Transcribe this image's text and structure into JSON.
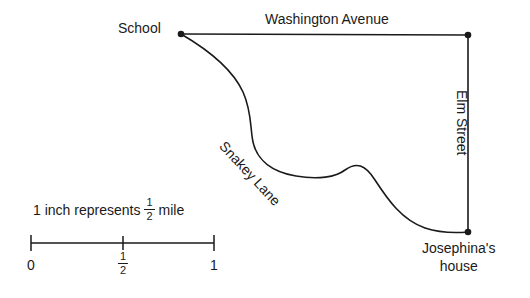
{
  "map": {
    "title_labels": {
      "school": "School",
      "washington_avenue": "Washington Avenue",
      "elm_street": "Elm Street",
      "snakey_lane": "Snakey Lane",
      "josephina_house_line1": "Josephina's",
      "josephina_house_line2": "house"
    },
    "nodes": [
      {
        "name": "school",
        "label": "School",
        "x": 181,
        "y": 34
      },
      {
        "name": "washington-elm-corner",
        "label": "",
        "x": 468,
        "y": 35
      },
      {
        "name": "josephina-house",
        "label": "Josephina's house",
        "x": 468,
        "y": 232
      }
    ],
    "roads": [
      {
        "name": "washington-avenue",
        "label": "Washington Avenue",
        "type": "straight"
      },
      {
        "name": "elm-street",
        "label": "Elm Street",
        "type": "straight"
      },
      {
        "name": "snakey-lane",
        "label": "Snakey Lane",
        "type": "curved"
      }
    ],
    "stroke_color": "#1a1a1a",
    "background_color": "#ffffff"
  },
  "scale": {
    "caption_prefix": "1 inch represents",
    "caption_fraction_numerator": "1",
    "caption_fraction_denominator": "2",
    "caption_suffix": "mile",
    "ticks": [
      {
        "name": "tick-0",
        "label": "0",
        "value": 0
      },
      {
        "name": "tick-half",
        "numerator": "1",
        "denominator": "2",
        "value": 0.5
      },
      {
        "name": "tick-1",
        "label": "1",
        "value": 1
      }
    ],
    "unit": "inch",
    "bar_start_x": 31,
    "bar_end_x": 214,
    "bar_y": 243
  }
}
